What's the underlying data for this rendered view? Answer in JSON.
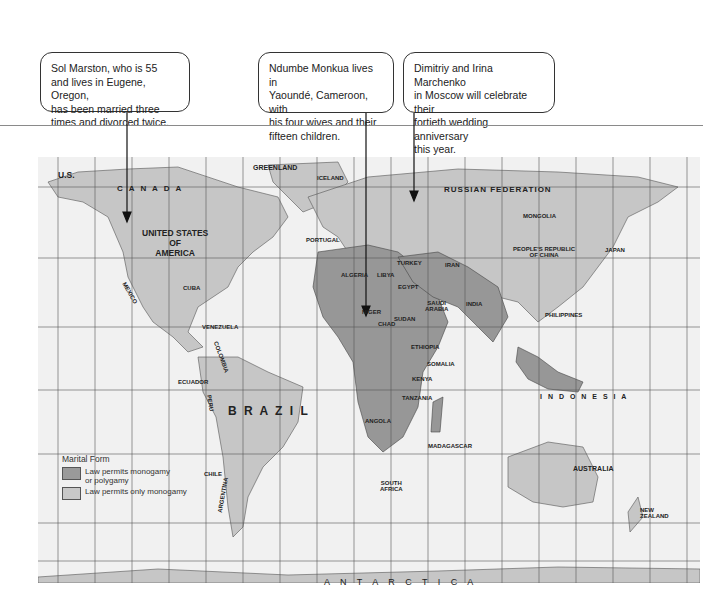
{
  "callouts": [
    {
      "text": "Sol Marston, who is 55\nand lives in Eugene, Oregon,\nhas been married three\ntimes and divorced twice."
    },
    {
      "text": "Ndumbe Monkua lives in\nYaoundé, Cameroon, with\nhis four wives and their\nfifteen children."
    },
    {
      "text": "Dimitriy and Irina Marchenko\nin Moscow will celebrate their\nfortieth wedding anniversary\nthis year."
    }
  ],
  "legend": {
    "title": "Marital Form",
    "items": [
      {
        "label": "Law permits monogamy\nor polygamy",
        "color": "#9a9a9a"
      },
      {
        "label": "Law permits only monogamy",
        "color": "#c8c8c8"
      }
    ]
  },
  "map_labels": {
    "canada": "C A N A D A",
    "greenland": "GREENLAND",
    "us_alaska": "U.S.",
    "usa": "UNITED STATES\nOF\nAMERICA",
    "russia": "RUSSIAN   FEDERATION",
    "mongolia": "MONGOLIA",
    "china": "PEOPLE'S REPUBLIC\nOF CHINA",
    "japan": "JAPAN",
    "india": "INDIA",
    "brazil": "B R A Z I L",
    "australia": "AUSTRALIA",
    "indonesia": "I N D O N E S I A",
    "philippines": "PHILIPPINES",
    "antarctica": "A N T A R C T I C A",
    "mexico": "MEXICO",
    "algeria": "ALGERIA",
    "libya": "LIBYA",
    "egypt": "EGYPT",
    "niger": "NIGER",
    "chad": "CHAD",
    "sudan": "SUDAN",
    "ethiopia": "ETHIOPIA",
    "somalia": "SOMALIA",
    "kenya": "KENYA",
    "tanzania": "TANZANIA",
    "angola": "ANGOLA",
    "madagascar": "MADAGASCAR",
    "south_africa": "SOUTH\nAFRICA",
    "argentina": "ARGENTINA",
    "chile": "CHILE",
    "peru": "PERU",
    "colombia": "COLOMBIA",
    "venezuela": "VENEZUELA",
    "ecuador": "ECUADOR",
    "turkey": "TURKEY",
    "iran": "IRAN",
    "saudi": "SAUDI\nARABIA",
    "kazakhstan": "KAZAKHSTAN",
    "new_zealand": "NEW\nZEALAND",
    "cuba": "CUBA",
    "portugal": "PORTUGAL",
    "iceland": "ICELAND"
  },
  "lat_ticks": [
    "80°",
    "40°",
    "20°",
    "0°",
    "20°",
    "40°",
    "60°"
  ]
}
